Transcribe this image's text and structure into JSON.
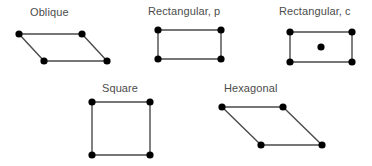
{
  "figure": {
    "background_color": "#ffffff",
    "edge_color": "#4a4a4a",
    "node_color": "#000000",
    "label_color": "#4c4c4c"
  },
  "cells": [
    {
      "id": "oblique",
      "label": "Oblique",
      "label_x": 30,
      "label_y": 6,
      "node_radius": 3.6,
      "nodes": [
        {
          "name": "vertex-top-left",
          "x": 19,
          "y": 34
        },
        {
          "name": "vertex-top-right",
          "x": 82,
          "y": 34
        },
        {
          "name": "vertex-bottom-left",
          "x": 44,
          "y": 61
        },
        {
          "name": "vertex-bottom-right",
          "x": 107,
          "y": 61
        }
      ],
      "edges": [
        {
          "x1": 19,
          "y1": 34,
          "x2": 82,
          "y2": 34
        },
        {
          "x1": 82,
          "y1": 34,
          "x2": 107,
          "y2": 61
        },
        {
          "x1": 107,
          "y1": 61,
          "x2": 44,
          "y2": 61
        },
        {
          "x1": 44,
          "y1": 61,
          "x2": 19,
          "y2": 34
        }
      ]
    },
    {
      "id": "rectangular-p",
      "label": "Rectangular, p",
      "label_x": 148,
      "label_y": 5,
      "node_radius": 3.6,
      "nodes": [
        {
          "name": "vertex-top-left",
          "x": 158,
          "y": 30
        },
        {
          "name": "vertex-top-right",
          "x": 221,
          "y": 30
        },
        {
          "name": "vertex-bottom-left",
          "x": 158,
          "y": 59
        },
        {
          "name": "vertex-bottom-right",
          "x": 221,
          "y": 59
        }
      ],
      "edges": [
        {
          "x1": 158,
          "y1": 30,
          "x2": 221,
          "y2": 30
        },
        {
          "x1": 221,
          "y1": 30,
          "x2": 221,
          "y2": 59
        },
        {
          "x1": 221,
          "y1": 59,
          "x2": 158,
          "y2": 59
        },
        {
          "x1": 158,
          "y1": 59,
          "x2": 158,
          "y2": 30
        }
      ]
    },
    {
      "id": "rectangular-c",
      "label": "Rectangular, c",
      "label_x": 279,
      "label_y": 5,
      "node_radius": 3.6,
      "nodes": [
        {
          "name": "vertex-top-left",
          "x": 290,
          "y": 32
        },
        {
          "name": "vertex-top-right",
          "x": 352,
          "y": 32
        },
        {
          "name": "vertex-bottom-left",
          "x": 290,
          "y": 62
        },
        {
          "name": "vertex-bottom-right",
          "x": 352,
          "y": 62
        },
        {
          "name": "center-node",
          "x": 321,
          "y": 47
        }
      ],
      "edges": [
        {
          "x1": 290,
          "y1": 32,
          "x2": 352,
          "y2": 32
        },
        {
          "x1": 352,
          "y1": 32,
          "x2": 352,
          "y2": 62
        },
        {
          "x1": 352,
          "y1": 62,
          "x2": 290,
          "y2": 62
        },
        {
          "x1": 290,
          "y1": 62,
          "x2": 290,
          "y2": 32
        }
      ]
    },
    {
      "id": "square",
      "label": "Square",
      "label_x": 102,
      "label_y": 82,
      "node_radius": 3.6,
      "nodes": [
        {
          "name": "vertex-top-left",
          "x": 92,
          "y": 102
        },
        {
          "name": "vertex-top-right",
          "x": 150,
          "y": 102
        },
        {
          "name": "vertex-bottom-left",
          "x": 92,
          "y": 155
        },
        {
          "name": "vertex-bottom-right",
          "x": 150,
          "y": 155
        }
      ],
      "edges": [
        {
          "x1": 92,
          "y1": 102,
          "x2": 150,
          "y2": 102
        },
        {
          "x1": 150,
          "y1": 102,
          "x2": 150,
          "y2": 155
        },
        {
          "x1": 150,
          "y1": 155,
          "x2": 92,
          "y2": 155
        },
        {
          "x1": 92,
          "y1": 155,
          "x2": 92,
          "y2": 102
        }
      ]
    },
    {
      "id": "hexagonal",
      "label": "Hexagonal",
      "label_x": 224,
      "label_y": 82,
      "node_radius": 3.6,
      "nodes": [
        {
          "name": "vertex-top-left",
          "x": 222,
          "y": 107
        },
        {
          "name": "vertex-top-right",
          "x": 283,
          "y": 107
        },
        {
          "name": "vertex-bottom-left",
          "x": 261,
          "y": 145
        },
        {
          "name": "vertex-bottom-right",
          "x": 322,
          "y": 145
        }
      ],
      "edges": [
        {
          "x1": 222,
          "y1": 107,
          "x2": 283,
          "y2": 107
        },
        {
          "x1": 283,
          "y1": 107,
          "x2": 322,
          "y2": 145
        },
        {
          "x1": 322,
          "y1": 145,
          "x2": 261,
          "y2": 145
        },
        {
          "x1": 261,
          "y1": 145,
          "x2": 222,
          "y2": 107
        }
      ]
    }
  ]
}
